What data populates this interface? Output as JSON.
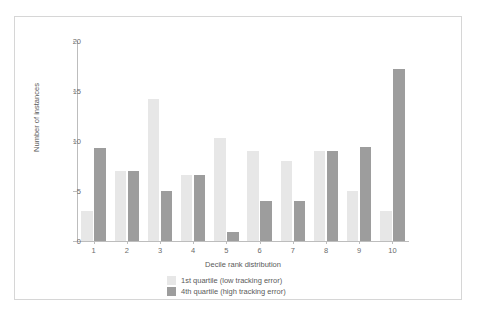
{
  "figure": {
    "frame_border_color": "#d6d6d6",
    "background": "#ffffff"
  },
  "top_strip": {
    "ghost_text": "",
    "ghost_icons": ""
  },
  "chart_data": {
    "type": "bar",
    "title": "",
    "xlabel": "Decile rank distribution",
    "ylabel": "Number of instances",
    "categories": [
      "1",
      "2",
      "3",
      "4",
      "5",
      "6",
      "7",
      "8",
      "9",
      "10"
    ],
    "series": [
      {
        "name": "1st quartile (low tracking error)",
        "color": "#e7e7e7",
        "values": [
          3.0,
          7.0,
          14.2,
          6.6,
          10.3,
          9.0,
          8.0,
          9.0,
          5.0,
          3.0
        ]
      },
      {
        "name": "4th quartile (high tracking error)",
        "color": "#9d9d9d",
        "values": [
          9.3,
          7.0,
          5.0,
          6.6,
          0.9,
          4.0,
          4.0,
          9.0,
          9.4,
          17.2
        ]
      }
    ],
    "ylim": [
      0,
      20
    ],
    "yticks": [
      0,
      5,
      10,
      15,
      20
    ],
    "grid": false,
    "legend_position": "bottom-left"
  },
  "legend": {
    "items": [
      {
        "label": "1st quartile (low tracking error)",
        "swatch": "q1"
      },
      {
        "label": "4th quartile (high tracking error)",
        "swatch": "q4"
      }
    ]
  }
}
